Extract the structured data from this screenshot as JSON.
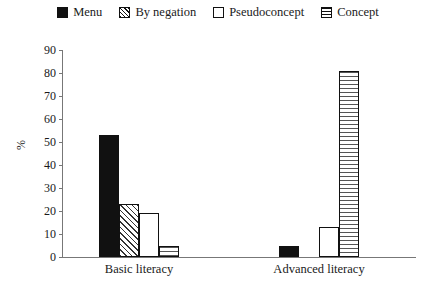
{
  "chart_data": {
    "type": "bar",
    "title": "",
    "xlabel": "",
    "ylabel": "%",
    "ylim": [
      0,
      90
    ],
    "yticks": [
      0,
      10,
      20,
      30,
      40,
      50,
      60,
      70,
      80,
      90
    ],
    "grid": false,
    "legend_position": "top-center",
    "categories": [
      "Basic literacy",
      "Advanced literacy"
    ],
    "series": [
      {
        "name": "Menu",
        "pattern": "solid",
        "values": [
          53,
          5
        ]
      },
      {
        "name": "By negation",
        "pattern": "hatch",
        "values": [
          23,
          0
        ]
      },
      {
        "name": "Pseudoconcept",
        "pattern": "empty",
        "values": [
          19,
          13
        ]
      },
      {
        "name": "Concept",
        "pattern": "hlines",
        "values": [
          5,
          81
        ]
      }
    ]
  },
  "legend": {
    "items": [
      {
        "label": "Menu",
        "swatch": "solid-square-icon"
      },
      {
        "label": "By negation",
        "swatch": "diagonal-hatch-square-icon"
      },
      {
        "label": "Pseudoconcept",
        "swatch": "empty-square-icon"
      },
      {
        "label": "Concept",
        "swatch": "horizontal-lines-square-icon"
      }
    ]
  },
  "axes": {
    "y_title": "%",
    "y_ticks": [
      "90",
      "80",
      "70",
      "60",
      "50",
      "40",
      "30",
      "20",
      "10",
      "0"
    ],
    "x_categories": [
      "Basic literacy",
      "Advanced literacy"
    ]
  },
  "colors": {
    "ink": "#111111",
    "axis": "#777777",
    "background": "#ffffff"
  }
}
